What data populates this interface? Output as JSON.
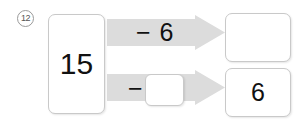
{
  "problem": {
    "number": "12",
    "type": "subtraction-flow-diagram"
  },
  "start_box": {
    "value": "15"
  },
  "rows": [
    {
      "operator_label": "− 6",
      "operator_symbol": "−",
      "operand": "6",
      "operand_blank": false,
      "result": "",
      "result_blank": true
    },
    {
      "operator_label": "−",
      "operator_symbol": "−",
      "operand": "",
      "operand_blank": true,
      "result": "6",
      "result_blank": false
    }
  ],
  "colors": {
    "arrow_fill": "#dcdcdc",
    "arrow_fill_light": "#e6e6e6",
    "box_border": "#c9c9c9",
    "text": "#111111",
    "badge_text": "#555555",
    "background": "#ffffff"
  }
}
